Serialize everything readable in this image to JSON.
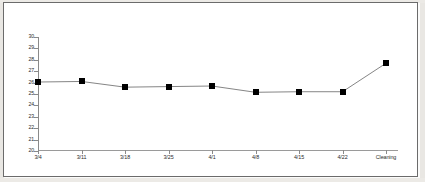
{
  "chart_data": {
    "type": "line",
    "title": "",
    "xlabel": "",
    "ylabel": "",
    "categories": [
      "3/4",
      "3/11",
      "3/18",
      "3/25",
      "4/1",
      "4/8",
      "4/15",
      "4/22",
      "Cleaning"
    ],
    "values": [
      26.05,
      26.1,
      25.6,
      25.65,
      25.7,
      25.15,
      25.2,
      25.2,
      27.7
    ],
    "ylim": [
      20,
      30
    ],
    "ytick_labels": [
      "30",
      "29",
      "28",
      "27",
      "26",
      "25",
      "24",
      "23",
      "22",
      "21",
      "20"
    ],
    "ytick_values": [
      30,
      29,
      28,
      27,
      26,
      25,
      24,
      23,
      22,
      21,
      20
    ],
    "grid": false,
    "legend": false,
    "marker": "square",
    "marker_color": "#000000",
    "line_color": "#666666"
  }
}
